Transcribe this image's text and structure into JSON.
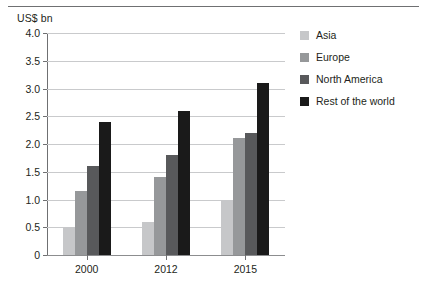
{
  "chart_data": {
    "type": "bar",
    "title": "",
    "subtitle": "",
    "xlabel": "",
    "ylabel": "US$ bn",
    "categories": [
      "2000",
      "2012",
      "2015"
    ],
    "series": [
      {
        "name": "Asia",
        "values": [
          0.5,
          0.6,
          1.0
        ],
        "color": "#c6c7c9"
      },
      {
        "name": "Europe",
        "values": [
          1.15,
          1.4,
          2.1
        ],
        "color": "#96989a"
      },
      {
        "name": "North America",
        "values": [
          1.6,
          1.8,
          2.2
        ],
        "color": "#58595b"
      },
      {
        "name": "Rest of the world",
        "values": [
          2.4,
          2.6,
          3.1
        ],
        "color": "#1a1a1a"
      }
    ],
    "ylim": [
      0,
      4.0
    ],
    "yticks": [
      "0",
      "0.5",
      "1.0",
      "1.5",
      "2.0",
      "2.5",
      "3.0",
      "3.5",
      "4.0"
    ],
    "ytick_values": [
      0,
      0.5,
      1.0,
      1.5,
      2.0,
      2.5,
      3.0,
      3.5,
      4.0
    ],
    "grid": true,
    "legend_position": "right"
  },
  "legend": {
    "items": [
      {
        "label": "Asia"
      },
      {
        "label": "Europe"
      },
      {
        "label": "North America"
      },
      {
        "label": "Rest of the world"
      }
    ]
  }
}
